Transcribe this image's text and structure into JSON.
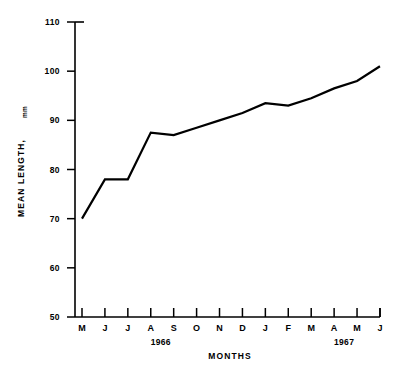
{
  "chart_data": {
    "type": "line",
    "title": "",
    "xlabel": "MONTHS",
    "ylabel": "MEAN LENGTH,",
    "ylabel_unit": "mm",
    "categories": [
      "M",
      "J",
      "J",
      "A",
      "S",
      "O",
      "N",
      "D",
      "J",
      "F",
      "M",
      "A",
      "M",
      "J"
    ],
    "values": [
      70,
      78,
      78,
      87.5,
      87,
      88.5,
      90,
      91.5,
      93.5,
      93,
      94.5,
      96.5,
      98,
      101
    ],
    "ylim": [
      50,
      110
    ],
    "ytick_labels": [
      "110",
      "100",
      "90",
      "80",
      "70",
      "60",
      "50"
    ],
    "ytick_values": [
      110,
      100,
      90,
      80,
      70,
      60,
      50
    ],
    "grid": false,
    "legend": "none",
    "period_labels": [
      {
        "text": "1966",
        "center_category_index": 3
      },
      {
        "text": "1967",
        "center_category_index": 11
      }
    ],
    "line_color": "#000000",
    "background_color": "#ffffff"
  }
}
